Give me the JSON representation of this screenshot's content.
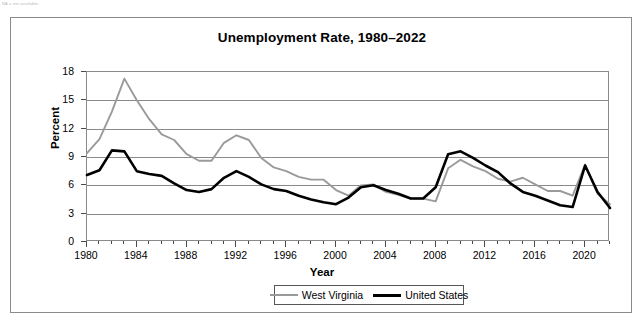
{
  "note": "NA = not available.",
  "figure": {
    "title": "Unemployment Rate, 1980–2022"
  },
  "axes": {
    "x": {
      "label": "Year",
      "ticks": [
        "1980",
        "1984",
        "1988",
        "1992",
        "1996",
        "2000",
        "2004",
        "2008",
        "2012",
        "2016",
        "2020"
      ],
      "min": 1980,
      "max": 2022,
      "minor_tick_step": 1
    },
    "y": {
      "label": "Percent",
      "ticks": [
        "0",
        "3",
        "6",
        "9",
        "12",
        "15",
        "18"
      ],
      "min": 0,
      "max": 18,
      "step": 3
    }
  },
  "legend": {
    "position": "bottom-center",
    "entries": [
      {
        "name": "West Virginia",
        "color": "#9a9a9a",
        "width": 2
      },
      {
        "name": "United States",
        "color": "#000000",
        "width": 3
      }
    ]
  },
  "colors": {
    "west_virginia": "#9a9a9a",
    "united_states": "#000000",
    "grid": "#8a8a8a",
    "frame": "#8a8a8a",
    "outer_border": "#8a8a8a"
  },
  "chart_data": {
    "type": "line",
    "title": "Unemployment Rate, 1980–2022",
    "xlabel": "Year",
    "ylabel": "Percent",
    "xlim": [
      1980,
      2022
    ],
    "ylim": [
      0,
      18
    ],
    "grid": true,
    "legend_position": "bottom-center",
    "x": [
      1980,
      1981,
      1982,
      1983,
      1984,
      1985,
      1986,
      1987,
      1988,
      1989,
      1990,
      1991,
      1992,
      1993,
      1994,
      1995,
      1996,
      1997,
      1998,
      1999,
      2000,
      2001,
      2002,
      2003,
      2004,
      2005,
      2006,
      2007,
      2008,
      2009,
      2010,
      2011,
      2012,
      2013,
      2014,
      2015,
      2016,
      2017,
      2018,
      2019,
      2020,
      2021,
      2022
    ],
    "series": [
      {
        "name": "West Virginia",
        "color": "#9a9a9a",
        "values": [
          9.4,
          10.9,
          13.8,
          17.3,
          15.0,
          13.0,
          11.4,
          10.8,
          9.3,
          8.6,
          8.6,
          10.5,
          11.3,
          10.8,
          8.9,
          7.9,
          7.5,
          6.9,
          6.6,
          6.6,
          5.5,
          4.9,
          6.0,
          6.1,
          5.3,
          5.0,
          4.6,
          4.6,
          4.3,
          7.8,
          8.7,
          8.0,
          7.5,
          6.7,
          6.4,
          6.8,
          6.1,
          5.4,
          5.4,
          4.9,
          8.2,
          5.1,
          4.0
        ]
      },
      {
        "name": "United States",
        "color": "#000000",
        "values": [
          7.1,
          7.6,
          9.7,
          9.6,
          7.5,
          7.2,
          7.0,
          6.2,
          5.5,
          5.3,
          5.6,
          6.8,
          7.5,
          6.9,
          6.1,
          5.6,
          5.4,
          4.9,
          4.5,
          4.2,
          4.0,
          4.7,
          5.8,
          6.0,
          5.5,
          5.1,
          4.6,
          4.6,
          5.8,
          9.3,
          9.6,
          8.9,
          8.1,
          7.4,
          6.2,
          5.3,
          4.9,
          4.4,
          3.9,
          3.7,
          8.1,
          5.3,
          3.6
        ]
      }
    ]
  }
}
